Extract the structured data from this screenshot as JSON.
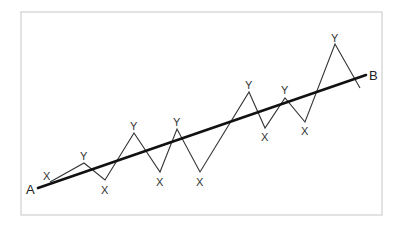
{
  "diagram": {
    "type": "trend-zigzag",
    "frame": {
      "x": 21,
      "y": 12,
      "w": 361,
      "h": 203
    },
    "trend_line": {
      "start": {
        "label": "A",
        "x": 38,
        "y": 188
      },
      "end": {
        "label": "B",
        "x": 366,
        "y": 75
      }
    },
    "zigzag": [
      {
        "label": "",
        "x": 50,
        "y": 182
      },
      {
        "label": "Y",
        "x": 84,
        "y": 163
      },
      {
        "label": "X",
        "x": 105,
        "y": 180
      },
      {
        "label": "Y",
        "x": 134,
        "y": 133
      },
      {
        "label": "X",
        "x": 160,
        "y": 172
      },
      {
        "label": "Y",
        "x": 177,
        "y": 129
      },
      {
        "label": "X",
        "x": 200,
        "y": 172
      },
      {
        "label": "Y",
        "x": 249,
        "y": 92
      },
      {
        "label": "X",
        "x": 265,
        "y": 128
      },
      {
        "label": "Y",
        "x": 285,
        "y": 98
      },
      {
        "label": "X",
        "x": 305,
        "y": 122
      },
      {
        "label": "Y",
        "x": 335,
        "y": 44
      },
      {
        "label": "",
        "x": 360,
        "y": 88
      }
    ],
    "labels": [
      {
        "id": "A",
        "text": "A",
        "x": 26,
        "y": 194
      },
      {
        "id": "B",
        "text": "B",
        "x": 369,
        "y": 80
      },
      {
        "id": "x1",
        "text": "X",
        "x": 43,
        "y": 180
      },
      {
        "id": "y1",
        "text": "Y",
        "x": 80,
        "y": 160
      },
      {
        "id": "x2",
        "text": "X",
        "x": 101,
        "y": 194
      },
      {
        "id": "y2",
        "text": "Y",
        "x": 130,
        "y": 130
      },
      {
        "id": "x3",
        "text": "X",
        "x": 156,
        "y": 186
      },
      {
        "id": "y3",
        "text": "Y",
        "x": 173,
        "y": 126
      },
      {
        "id": "x4",
        "text": "X",
        "x": 196,
        "y": 186
      },
      {
        "id": "y4",
        "text": "Y",
        "x": 245,
        "y": 89
      },
      {
        "id": "x5",
        "text": "X",
        "x": 261,
        "y": 141
      },
      {
        "id": "y5",
        "text": "Y",
        "x": 281,
        "y": 94
      },
      {
        "id": "x6",
        "text": "X",
        "x": 301,
        "y": 135
      },
      {
        "id": "y6",
        "text": "Y",
        "x": 331,
        "y": 42
      }
    ]
  }
}
